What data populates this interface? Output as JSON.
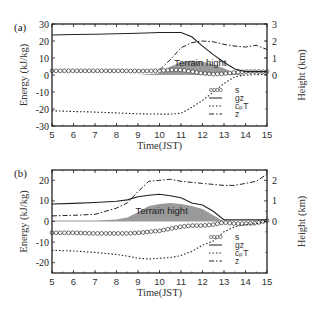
{
  "chart_data": [
    {
      "panel": "(a)",
      "type": "line",
      "xlabel": "Time(JST)",
      "ylabel": "Energy (kJ/kg)",
      "ylabel_right": "Height (km)",
      "xlim": [
        5,
        15
      ],
      "ylim": [
        -30,
        30
      ],
      "ylim_right": [
        -3,
        3
      ],
      "xticks": [
        "5",
        "6",
        "7",
        "8",
        "9",
        "10",
        "11",
        "12",
        "13",
        "14",
        "15"
      ],
      "yticks": [
        "30",
        "20",
        "10",
        "0",
        "-10",
        "-20",
        "-30"
      ],
      "yticks_right": [
        "3",
        "2",
        "1",
        "0"
      ],
      "annotation": "Terrain hight",
      "legend": [
        "s",
        "gz",
        "c_pT",
        "z"
      ],
      "x": [
        5,
        6,
        7,
        8,
        9,
        10,
        10.5,
        11,
        11.5,
        12,
        12.5,
        13,
        13.5,
        14,
        14.5,
        15
      ],
      "series": [
        {
          "name": "s",
          "axis": "left",
          "values": [
            2.5,
            2.5,
            2.5,
            2.5,
            2.3,
            2.5,
            3,
            3,
            2,
            1,
            0.5,
            0.8,
            1.5,
            2,
            2,
            2
          ]
        },
        {
          "name": "gz",
          "axis": "left",
          "values": [
            23.5,
            23.8,
            24.0,
            24.3,
            24.6,
            25.0,
            25.0,
            25.0,
            22.5,
            17.0,
            12.0,
            7.5,
            3.5,
            2.0,
            2.0,
            2.0
          ]
        },
        {
          "name": "c_pT",
          "axis": "left",
          "values": [
            -21,
            -21.5,
            -21.8,
            -22.3,
            -22.8,
            -23,
            -23,
            -22.5,
            -19,
            -15,
            -10,
            -5,
            -1,
            0,
            0.2,
            0.5
          ]
        },
        {
          "name": "z",
          "axis": "right",
          "values": [
            null,
            null,
            null,
            null,
            null,
            0.3,
            0.9,
            1.6,
            1.9,
            2.0,
            1.95,
            1.8,
            1.7,
            1.65,
            1.75,
            1.5
          ]
        },
        {
          "name": "terrain",
          "axis": "right",
          "type": "area",
          "values": [
            0,
            0,
            0,
            0,
            0,
            0.1,
            0.5,
            0.75,
            0.85,
            0.8,
            0.6,
            0.4,
            0.1,
            0,
            0,
            0
          ]
        }
      ]
    },
    {
      "panel": "(b)",
      "type": "line",
      "xlabel": "Time(JST)",
      "ylabel": "Energy (kJ/kg)",
      "ylabel_right": "Height (km)",
      "xlim": [
        5,
        15
      ],
      "ylim": [
        -25,
        25
      ],
      "ylim_right": [
        -2.5,
        2.5
      ],
      "xticks": [
        "5",
        "6",
        "7",
        "8",
        "9",
        "10",
        "11",
        "12",
        "13",
        "14",
        "15"
      ],
      "yticks": [
        "20",
        "10",
        "0",
        "-10",
        "-20"
      ],
      "yticks_right": [
        "2",
        "1",
        "0"
      ],
      "annotation": "Terrain hight",
      "legend": [
        "s",
        "gz",
        "c_pT",
        "z"
      ],
      "x": [
        5,
        6,
        7,
        8,
        8.5,
        9,
        9.5,
        10,
        10.5,
        11,
        11.5,
        12,
        12.5,
        13,
        13.5,
        14,
        14.5,
        15
      ],
      "series": [
        {
          "name": "s",
          "axis": "left",
          "values": [
            -5.5,
            -5.5,
            -5.8,
            -5.8,
            -5.8,
            -5.5,
            -5.0,
            -4.5,
            -3.5,
            -2.5,
            -2.0,
            -2.0,
            -1.5,
            -0.5,
            -1.0,
            -1.0,
            -0.8,
            0.5
          ]
        },
        {
          "name": "gz",
          "axis": "left",
          "values": [
            8.5,
            8.8,
            9.2,
            9.8,
            10.5,
            12.0,
            12.7,
            13.2,
            12.5,
            11.5,
            9.0,
            8.0,
            5.0,
            0.8,
            0.8,
            0.8,
            0.8,
            0.8
          ]
        },
        {
          "name": "c_pT",
          "axis": "left",
          "values": [
            -14,
            -14.3,
            -15,
            -16,
            -16.8,
            -17.8,
            -18.2,
            -17.8,
            -17.5,
            -16.5,
            -14.5,
            -11.5,
            -9.5,
            -5,
            -2.5,
            -1.5,
            -1,
            0
          ]
        },
        {
          "name": "z",
          "axis": "right",
          "values": [
            0.27,
            0.3,
            0.35,
            0.65,
            0.9,
            1.45,
            1.95,
            2.0,
            2.05,
            1.95,
            1.9,
            1.85,
            1.8,
            1.75,
            1.75,
            1.85,
            1.95,
            2.3
          ]
        },
        {
          "name": "terrain",
          "axis": "right",
          "type": "area",
          "values": [
            0.05,
            0.05,
            0.05,
            0.1,
            0.2,
            0.45,
            0.75,
            0.85,
            0.9,
            0.85,
            0.75,
            0.6,
            0.3,
            0,
            0,
            0,
            0,
            0
          ]
        }
      ]
    }
  ]
}
